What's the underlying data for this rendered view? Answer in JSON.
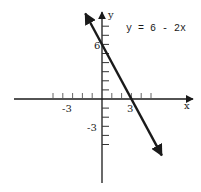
{
  "chart_data": {
    "type": "line",
    "title": "",
    "equation_label": "y = 6 - 2x",
    "xlabel": "x",
    "ylabel": "y",
    "x_tick_labels": [
      {
        "value": -3,
        "label": "-3"
      },
      {
        "value": 3,
        "label": "3"
      }
    ],
    "y_tick_labels": [
      {
        "value": 6,
        "label": "6"
      },
      {
        "value": -3,
        "label": "-3"
      }
    ],
    "x_ticks": [
      -5,
      -4,
      -3,
      -2,
      -1,
      1,
      2,
      3,
      4,
      5
    ],
    "y_ticks": [
      -5,
      -4,
      -3,
      -2,
      -1,
      1,
      2,
      3,
      4,
      5,
      6,
      7,
      8
    ],
    "xlim": [
      -6.5,
      9.5
    ],
    "ylim": [
      -9,
      9.5
    ],
    "grid": false,
    "legend": "none",
    "series": [
      {
        "name": "y = 6 - 2x",
        "slope": -2,
        "intercept": 6,
        "x": [
          -1.7,
          6.1
        ],
        "y": [
          9.4,
          -6.2
        ],
        "arrows": "both",
        "points": [
          {
            "x": 0,
            "y": 6
          },
          {
            "x": 3,
            "y": 0
          }
        ]
      }
    ]
  },
  "colors": {
    "ink": "#1a1a1a",
    "background": "#ffffff"
  }
}
